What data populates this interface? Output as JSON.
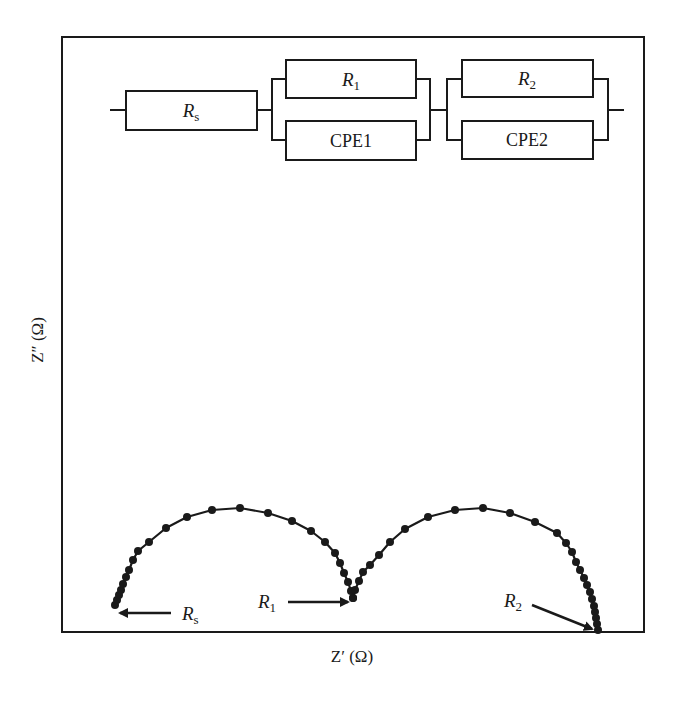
{
  "chart_data": {
    "type": "scatter",
    "subtype": "nyquist-impedance-plot",
    "title": "",
    "xlabel": "Z′ (Ω)",
    "ylabel": "Z″ (Ω)",
    "grid": false,
    "ticks": "none",
    "legend": "none",
    "frame": {
      "x0": 62,
      "y0": 37,
      "x1": 644,
      "y1": 632
    },
    "series": [
      {
        "name": "semicircle-1",
        "points": [
          [
            115,
            605
          ],
          [
            117,
            600
          ],
          [
            119,
            595
          ],
          [
            121,
            590
          ],
          [
            123,
            584
          ],
          [
            126,
            577
          ],
          [
            129,
            570
          ],
          [
            133,
            560
          ],
          [
            138,
            551
          ],
          [
            149,
            542
          ],
          [
            166,
            528
          ],
          [
            187,
            517
          ],
          [
            212,
            510
          ],
          [
            240,
            508
          ],
          [
            268,
            513
          ],
          [
            292,
            521
          ],
          [
            311,
            531
          ],
          [
            325,
            542
          ],
          [
            335,
            553
          ],
          [
            340,
            563
          ],
          [
            344,
            573
          ],
          [
            348,
            582
          ],
          [
            351,
            591
          ],
          [
            353,
            598
          ]
        ]
      },
      {
        "name": "semicircle-2",
        "points": [
          [
            353,
            598
          ],
          [
            355,
            590
          ],
          [
            359,
            581
          ],
          [
            363,
            572
          ],
          [
            370,
            565
          ],
          [
            379,
            555
          ],
          [
            390,
            542
          ],
          [
            405,
            529
          ],
          [
            428,
            517
          ],
          [
            455,
            510
          ],
          [
            483,
            508
          ],
          [
            510,
            513
          ],
          [
            535,
            522
          ],
          [
            557,
            533
          ],
          [
            566,
            543
          ],
          [
            572,
            552
          ],
          [
            576,
            562
          ],
          [
            580,
            570
          ],
          [
            584,
            578
          ],
          [
            587,
            585
          ],
          [
            590,
            592
          ],
          [
            592,
            599
          ],
          [
            594,
            606
          ],
          [
            595,
            612
          ],
          [
            596,
            618
          ],
          [
            597,
            624
          ],
          [
            598,
            630
          ]
        ]
      }
    ],
    "annotations": [
      {
        "label": "R",
        "sub": "s",
        "text_x": 182,
        "text_y": 620,
        "arrow_from": [
          171,
          613
        ],
        "arrow_to": [
          120,
          613
        ]
      },
      {
        "label": "R",
        "sub": "1",
        "text_x": 258,
        "text_y": 608,
        "arrow_from": [
          288,
          602
        ],
        "arrow_to": [
          348,
          602
        ]
      },
      {
        "label": "R",
        "sub": "2",
        "text_x": 504,
        "text_y": 607,
        "arrow_from": [
          532,
          605
        ],
        "arrow_to": [
          594,
          630
        ]
      }
    ],
    "equivalent_circuit": {
      "wire_y": 110,
      "elements": [
        {
          "id": "Rs",
          "label": "R",
          "sub": "s",
          "italic": true,
          "x": 126,
          "y": 91,
          "w": 131,
          "h": 39
        },
        {
          "id": "R1",
          "label": "R",
          "sub": "1",
          "italic": true,
          "x": 286,
          "y": 60,
          "w": 130,
          "h": 38
        },
        {
          "id": "CPE1",
          "label": "CPE1",
          "sub": "",
          "italic": false,
          "x": 286,
          "y": 121,
          "w": 130,
          "h": 39
        },
        {
          "id": "R2",
          "label": "R",
          "sub": "2",
          "italic": true,
          "x": 462,
          "y": 60,
          "w": 131,
          "h": 37
        },
        {
          "id": "CPE2",
          "label": "CPE2",
          "sub": "",
          "italic": false,
          "x": 462,
          "y": 121,
          "w": 131,
          "h": 38
        }
      ],
      "topology": "Rs in series with (R1 || CPE1) in series with (R2 || CPE2)"
    }
  },
  "axes": {
    "x_label": "Z′ (Ω)",
    "y_label": "Z″ (Ω)"
  },
  "circuit": {
    "rs": {
      "main": "R",
      "sub": "s"
    },
    "r1": {
      "main": "R",
      "sub": "1"
    },
    "cpe1": {
      "main": "CPE1"
    },
    "r2": {
      "main": "R",
      "sub": "2"
    },
    "cpe2": {
      "main": "CPE2"
    }
  },
  "annotations": {
    "rs": {
      "main": "R",
      "sub": "s"
    },
    "r1": {
      "main": "R",
      "sub": "1"
    },
    "r2": {
      "main": "R",
      "sub": "2"
    }
  },
  "colors": {
    "ink": "#1a1a1a",
    "background": "#ffffff"
  }
}
